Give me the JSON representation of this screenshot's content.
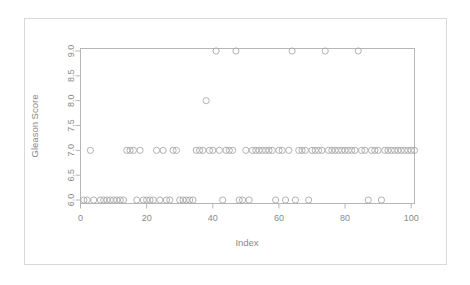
{
  "figure": {
    "background_color": "#ffffff",
    "frame_color": "#d8d8d8",
    "axis_color": "#b6b6b6",
    "point_color": "#a9a9a9",
    "text_color": "#8a8a8a"
  },
  "chart_data": {
    "type": "scatter",
    "title": "",
    "subtitle": "",
    "xlabel": "Index",
    "ylabel": "Gleason Score",
    "xlim": [
      0,
      101
    ],
    "ylim": [
      5.93,
      9.05
    ],
    "xticks": [
      0,
      20,
      40,
      60,
      80,
      100
    ],
    "xticklabels": [
      "0",
      "20",
      "40",
      "60",
      "80",
      "100"
    ],
    "yticks": [
      6.0,
      6.5,
      7.0,
      7.5,
      8.0,
      8.5,
      9.0
    ],
    "yticklabels": [
      "6.0",
      "6.5",
      "7.0",
      "7.5",
      "8.0",
      "8.5",
      "9.0"
    ],
    "grid": false,
    "legend": null,
    "marker": "open-circle",
    "marker_size": 3.1,
    "n_points": 100,
    "x": [
      1,
      2,
      3,
      4,
      6,
      7,
      8,
      9,
      10,
      11,
      12,
      13,
      14,
      15,
      16,
      17,
      18,
      19,
      20,
      21,
      22,
      23,
      24,
      25,
      26,
      27,
      28,
      29,
      30,
      31,
      32,
      33,
      34,
      35,
      36,
      37,
      38,
      39,
      40,
      41,
      42,
      43,
      44,
      45,
      46,
      47,
      48,
      49,
      50,
      51,
      52,
      53,
      54,
      55,
      56,
      57,
      58,
      59,
      60,
      61,
      62,
      63,
      64,
      65,
      66,
      67,
      68,
      69,
      70,
      71,
      72,
      73,
      74,
      75,
      76,
      77,
      78,
      79,
      80,
      81,
      82,
      83,
      84,
      85,
      86,
      87,
      88,
      89,
      90,
      91,
      92,
      93,
      94,
      95,
      96,
      97,
      98,
      99,
      100,
      101
    ],
    "y": [
      6,
      6,
      7,
      6,
      6,
      6,
      6,
      6,
      6,
      6,
      6,
      6,
      7,
      7,
      7,
      6,
      7,
      6,
      6,
      6,
      6,
      7,
      6,
      7,
      6,
      6,
      7,
      7,
      6,
      6,
      6,
      6,
      6,
      7,
      7,
      7,
      8,
      7,
      7,
      9,
      7,
      6,
      7,
      7,
      7,
      9,
      6,
      6,
      7,
      6,
      7,
      7,
      7,
      7,
      7,
      7,
      7,
      6,
      7,
      7,
      6,
      7,
      9,
      6,
      7,
      7,
      7,
      6,
      7,
      7,
      7,
      7,
      9,
      7,
      7,
      7,
      7,
      7,
      7,
      7,
      7,
      7,
      9,
      7,
      7,
      6,
      7,
      7,
      7,
      6,
      7,
      7,
      7,
      7,
      7,
      7,
      7,
      7,
      7,
      7
    ],
    "value_counts": [
      {
        "score": 6,
        "count": 33
      },
      {
        "score": 7,
        "count": 61
      },
      {
        "score": 8,
        "count": 1
      },
      {
        "score": 9,
        "count": 5
      }
    ],
    "highlight_points": [
      {
        "index": 41,
        "score": 9
      },
      {
        "index": 47,
        "score": 9
      },
      {
        "index": 64,
        "score": 9
      },
      {
        "index": 74,
        "score": 9
      },
      {
        "index": 84,
        "score": 9
      },
      {
        "index": 38,
        "score": 8
      }
    ]
  }
}
